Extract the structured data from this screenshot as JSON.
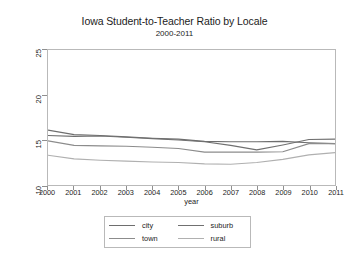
{
  "chart_data": {
    "type": "line",
    "title": "Iowa Student-to-Teacher Ratio by Locale",
    "subtitle": "2000-2011",
    "xlabel": "year",
    "ylabel": "State stu/tfe ratio by Locale",
    "xlim": [
      2000,
      2011
    ],
    "ylim": [
      10,
      25
    ],
    "yticks": [
      "10",
      "15",
      "20",
      "25"
    ],
    "ytick_values": [
      10,
      15,
      20,
      25
    ],
    "grid": false,
    "legend_position": "bottom",
    "x": [
      2000,
      2001,
      2002,
      2003,
      2004,
      2005,
      2006,
      2007,
      2008,
      2009,
      2010,
      2011
    ],
    "xticks": [
      "2000",
      "2001",
      "2002",
      "2003",
      "2004",
      "2005",
      "2006",
      "2007",
      "2008",
      "2009",
      "2010",
      "2011"
    ],
    "series": [
      {
        "name": "city",
        "color": "#6e6e6e",
        "values": [
          16.1,
          15.6,
          15.5,
          15.35,
          15.2,
          15.1,
          14.85,
          14.8,
          14.8,
          14.85,
          14.7,
          14.6
        ]
      },
      {
        "name": "suburb",
        "color": "#707070",
        "values": [
          15.5,
          15.4,
          15.45,
          15.3,
          15.15,
          15.0,
          14.8,
          14.4,
          13.9,
          14.45,
          15.05,
          15.1
        ]
      },
      {
        "name": "town",
        "color": "#8c8c8c",
        "values": [
          14.9,
          14.4,
          14.35,
          14.3,
          14.2,
          14.05,
          13.65,
          13.65,
          13.65,
          13.7,
          14.6,
          14.6
        ]
      },
      {
        "name": "rural",
        "color": "#b0b0b0",
        "values": [
          13.3,
          12.9,
          12.75,
          12.65,
          12.55,
          12.5,
          12.35,
          12.3,
          12.5,
          12.85,
          13.35,
          13.6
        ]
      }
    ]
  },
  "legend": {
    "items": [
      {
        "label": "city"
      },
      {
        "label": "suburb"
      },
      {
        "label": "town"
      },
      {
        "label": "rural"
      }
    ]
  }
}
